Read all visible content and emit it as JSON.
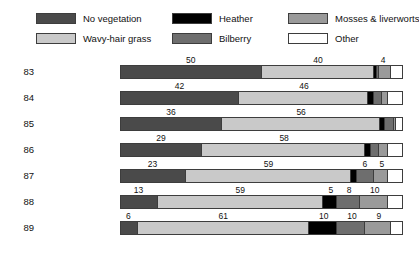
{
  "chart_data": {
    "type": "bar",
    "subtype": "stacked-horizontal-percent",
    "title": "",
    "xlabel": "",
    "ylabel": "",
    "xlim": [
      0,
      100
    ],
    "grid": false,
    "legend_position": "top",
    "categories": [
      "83",
      "84",
      "85",
      "86",
      "87",
      "88",
      "89"
    ],
    "series": [
      {
        "name": "No vegetation",
        "color": "#4a4a4a",
        "values": [
          50,
          42,
          36,
          29,
          23,
          13,
          6
        ]
      },
      {
        "name": "Wavy-hair grass",
        "color": "#c9c9c9",
        "values": [
          40,
          46,
          56,
          58,
          59,
          59,
          61
        ]
      },
      {
        "name": "Heather",
        "color": "#000000",
        "values": [
          1,
          2,
          2,
          2,
          2,
          5,
          10
        ]
      },
      {
        "name": "Bilberry",
        "color": "#6e6e6e",
        "values": [
          1,
          3,
          3,
          3,
          6,
          8,
          10
        ]
      },
      {
        "name": "Mosses & liverworts",
        "color": "#9a9a9a",
        "values": [
          4,
          2,
          1,
          3,
          5,
          10,
          9
        ]
      },
      {
        "name": "Other",
        "color": "#ffffff",
        "values": [
          4,
          5,
          2,
          5,
          5,
          5,
          4
        ]
      }
    ],
    "bar_labels": [
      [
        {
          "text": "50",
          "center": 25.0
        },
        {
          "text": "40",
          "center": 70.0
        },
        {
          "text": "4",
          "center": 93.0
        }
      ],
      [
        {
          "text": "42",
          "center": 21.0
        },
        {
          "text": "46",
          "center": 65.0
        }
      ],
      [
        {
          "text": "36",
          "center": 18.0
        },
        {
          "text": "56",
          "center": 64.0
        }
      ],
      [
        {
          "text": "29",
          "center": 14.5
        },
        {
          "text": "58",
          "center": 58.0
        }
      ],
      [
        {
          "text": "23",
          "center": 11.5
        },
        {
          "text": "59",
          "center": 52.5
        },
        {
          "text": "6",
          "center": 86.5
        },
        {
          "text": "5",
          "center": 92.5
        }
      ],
      [
        {
          "text": "13",
          "center": 6.5
        },
        {
          "text": "59",
          "center": 42.5
        },
        {
          "text": "5",
          "center": 74.5
        },
        {
          "text": "8",
          "center": 81.0
        },
        {
          "text": "10",
          "center": 90.0
        }
      ],
      [
        {
          "text": "6",
          "center": 3.0
        },
        {
          "text": "61",
          "center": 36.5
        },
        {
          "text": "10",
          "center": 72.0
        },
        {
          "text": "10",
          "center": 82.0
        },
        {
          "text": "9",
          "center": 91.5
        }
      ]
    ]
  },
  "legend": {
    "items": [
      {
        "label": "No vegetation",
        "color": "#4a4a4a"
      },
      {
        "label": "Wavy-hair grass",
        "color": "#c9c9c9"
      },
      {
        "label": "Heather",
        "color": "#000000"
      },
      {
        "label": "Bilberry",
        "color": "#6e6e6e"
      },
      {
        "label": "Mosses & liverworts",
        "color": "#9a9a9a"
      },
      {
        "label": "Other",
        "color": "#ffffff"
      }
    ]
  }
}
